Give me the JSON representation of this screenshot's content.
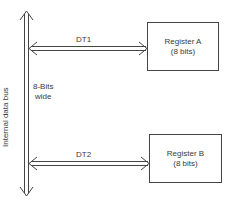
{
  "diagram": {
    "bus": {
      "label": "Internal data bus",
      "width_label_line1": "8-Bits",
      "width_label_line2": "wide"
    },
    "transfers": [
      {
        "label": "DT1",
        "target": "Register A"
      },
      {
        "label": "DT2",
        "target": "Register B"
      }
    ],
    "registers": [
      {
        "name": "Register A",
        "size": "(8 bits)"
      },
      {
        "name": "Register B",
        "size": "(8 bits)"
      }
    ],
    "colors": {
      "line": "#444444",
      "text": "#3a3a3a",
      "background": "#ffffff"
    }
  }
}
